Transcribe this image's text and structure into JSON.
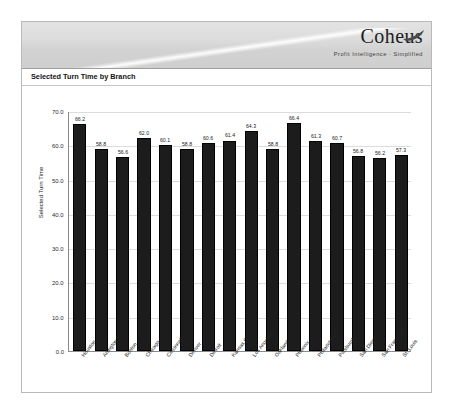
{
  "report": {
    "logo": {
      "wordmark": "Coheus",
      "tagline": "Profit Intelligence · Simplified",
      "feather_icon": "feather-swoosh-icon"
    },
    "title": "Selected Turn Time by Branch"
  },
  "chart_data": {
    "type": "bar",
    "title": "Selected Turn Time by Branch",
    "xlabel": "",
    "ylabel": "Selected Turn Time",
    "ylim": [
      0.0,
      70.0
    ],
    "ytick_labels": [
      "70.0",
      "60.0",
      "50.0",
      "40.0",
      "30.0",
      "20.0",
      "10.0",
      "0.0"
    ],
    "ytick_values": [
      70.0,
      60.0,
      50.0,
      40.0,
      30.0,
      20.0,
      10.0,
      0.0
    ],
    "grid": true,
    "legend": "none",
    "bar_color": "#1c1c1c",
    "categories": [
      "Houston",
      "Arlington",
      "Boston",
      "Chicago",
      "Cincinnati",
      "Denver",
      "Detroit",
      "Kansas City",
      "Los Angeles",
      "Oakland",
      "Phoenix",
      "Philadelphia",
      "Pittsburgh",
      "San Diego",
      "San Francisco",
      "St. Louis"
    ],
    "values": [
      66.2,
      58.8,
      56.6,
      62.0,
      60.1,
      58.8,
      60.6,
      61.4,
      64.3,
      58.8,
      66.4,
      61.3,
      60.7,
      56.8,
      56.2,
      57.3
    ],
    "value_labels": [
      "66.2",
      "58.8",
      "56.6",
      "62.0",
      "60.1",
      "58.8",
      "60.6",
      "61.4",
      "64.3",
      "58.8",
      "66.4",
      "61.3",
      "60.7",
      "56.8",
      "56.2",
      "57.3"
    ]
  }
}
